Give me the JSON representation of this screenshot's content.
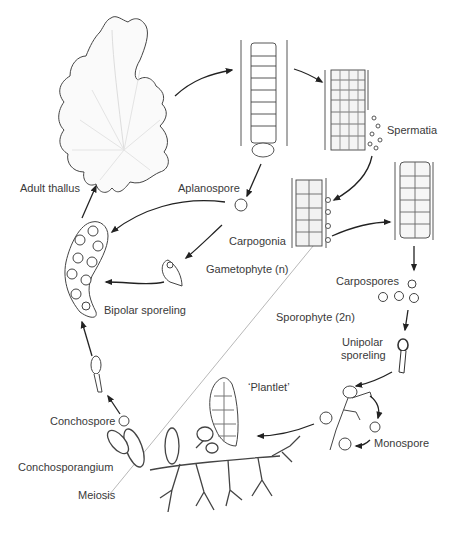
{
  "diagram": {
    "type": "life-cycle",
    "organism_stages": {
      "adult_thallus": "Adult thallus",
      "aplanospore": "Aplanospore",
      "spermatia": "Spermatia",
      "carpogonia": "Carpogonia",
      "gametophyte": "Gametophyte (n)",
      "sporophyte": "Sporophyte (2n)",
      "carpospores": "Carpospores",
      "unipolar_sporeling_1": "Unipolar",
      "unipolar_sporeling_2": "sporeling",
      "monospore": "Monospore",
      "plantlet": "‘Plantlet’",
      "conchospore": "Conchospore",
      "conchosporangium": "Conchosporangium",
      "meiosis": "Meiosis",
      "bipolar_sporeling": "Bipolar sporeling"
    },
    "colors": {
      "stroke": "#333333",
      "divider": "#b0b0b0",
      "fill": "#ffffff"
    }
  }
}
